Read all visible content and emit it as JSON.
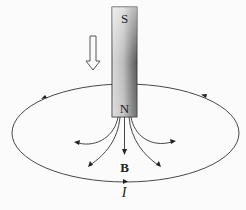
{
  "diagram": {
    "magnet": {
      "top_pole": "S",
      "bottom_pole": "N"
    },
    "field_label": "B",
    "current_label": "I",
    "motion_arrow": "downward-hollow-arrow",
    "loop": "current-loop-ellipse",
    "colors": {
      "line": "#333333",
      "magnet_dark": "#6e6e6e",
      "magnet_light": "#e8e8e8"
    }
  }
}
